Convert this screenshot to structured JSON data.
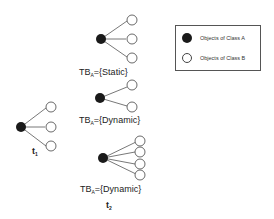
{
  "diagram": {
    "time_labels": {
      "t1": {
        "base": "t",
        "sub": "1"
      },
      "t2": {
        "base": "t",
        "sub": "2"
      }
    },
    "trees": [
      {
        "id": "t1-tree",
        "label": null,
        "class_a_nodes": 1,
        "class_b_children": 3
      },
      {
        "id": "static-tree",
        "label": {
          "base": "TB",
          "sub": "A",
          "rest": "={Static}"
        },
        "class_a_nodes": 1,
        "class_b_children": 3
      },
      {
        "id": "dynamic-tree-1",
        "label": {
          "base": "TB",
          "sub": "A",
          "rest": "={Dynamic}"
        },
        "class_a_nodes": 1,
        "class_b_children": 2
      },
      {
        "id": "dynamic-tree-2",
        "label": {
          "base": "TB",
          "sub": "A",
          "rest": "={Dynamic}"
        },
        "class_a_nodes": 1,
        "class_b_children": 4
      }
    ],
    "legend": {
      "items": [
        {
          "label": "Objects of Class A",
          "fill": "#1a1a1a"
        },
        {
          "label": "Objects of Class B",
          "fill": "#ffffff"
        }
      ]
    },
    "colors": {
      "class_a": "#1a1a1a",
      "class_b_stroke": "#444444",
      "edge": "#555555"
    }
  }
}
